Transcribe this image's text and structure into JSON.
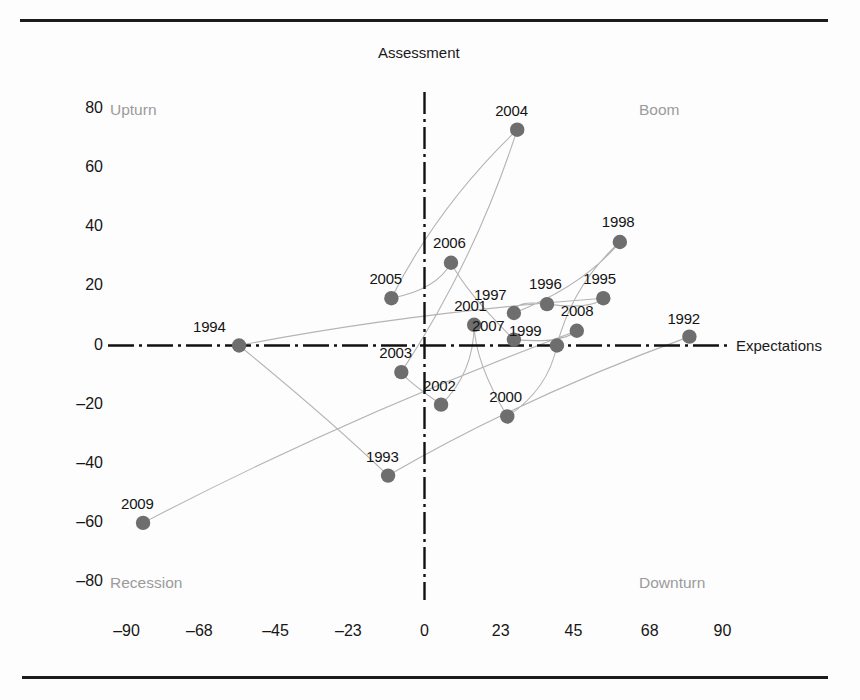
{
  "figure": {
    "background_color": "#fdfdfd",
    "rule_color": "#1c1c1c",
    "point_color": "#6e6e6e",
    "line_color": "#b4b4b4",
    "axis_color": "#111111",
    "quadrant_label_color": "#9b9b9b"
  },
  "axes": {
    "y_axis_title": "Assessment",
    "x_axis_title": "Expectations",
    "y_ticks": [
      "80",
      "60",
      "40",
      "20",
      "0",
      "–20",
      "–40",
      "–60",
      "–80"
    ],
    "x_ticks": [
      "–90",
      "–68",
      "–45",
      "–23",
      "0",
      "23",
      "45",
      "68",
      "90"
    ]
  },
  "quadrants": {
    "top_left": "Upturn",
    "top_right": "Boom",
    "bottom_left": "Recession",
    "bottom_right": "Downturn"
  },
  "chart_data": {
    "type": "scatter",
    "title": "",
    "subtitle": "",
    "xlabel": "Expectations",
    "ylabel": "Assessment",
    "xlim": [
      -100,
      100
    ],
    "ylim": [
      -88,
      88
    ],
    "grid": false,
    "legend": "none",
    "annotations": [
      "Upturn",
      "Boom",
      "Recession",
      "Downturn"
    ],
    "connected": true,
    "connection_order": [
      "1992",
      "1993",
      "1994",
      "1995",
      "1996",
      "1997",
      "1998",
      "1999",
      "2000",
      "2001",
      "2002",
      "2003",
      "2004",
      "2005",
      "2006",
      "2007",
      "2008",
      "2009"
    ],
    "x_tick_values": [
      -90,
      -68,
      -45,
      -23,
      0,
      23,
      45,
      68,
      90
    ],
    "y_tick_values": [
      80,
      60,
      40,
      20,
      0,
      -20,
      -40,
      -60,
      -80
    ],
    "points": [
      {
        "label": "1992",
        "x": 80,
        "y": 3
      },
      {
        "label": "1993",
        "x": -11,
        "y": -44
      },
      {
        "label": "1994",
        "x": -56,
        "y": 0
      },
      {
        "label": "1995",
        "x": 54,
        "y": 16
      },
      {
        "label": "1996",
        "x": 37,
        "y": 14
      },
      {
        "label": "1997",
        "x": 27,
        "y": 11
      },
      {
        "label": "1998",
        "x": 59,
        "y": 35
      },
      {
        "label": "1999",
        "x": 40,
        "y": 0
      },
      {
        "label": "2000",
        "x": 25,
        "y": -24
      },
      {
        "label": "2001",
        "x": 15,
        "y": 7
      },
      {
        "label": "2002",
        "x": 5,
        "y": -20
      },
      {
        "label": "2003",
        "x": -7,
        "y": -9
      },
      {
        "label": "2004",
        "x": 28,
        "y": 73
      },
      {
        "label": "2005",
        "x": -10,
        "y": 16
      },
      {
        "label": "2006",
        "x": 8,
        "y": 28
      },
      {
        "label": "2007",
        "x": 27,
        "y": 2
      },
      {
        "label": "2008",
        "x": 46,
        "y": 5
      },
      {
        "label": "2009",
        "x": -85,
        "y": -60
      }
    ]
  }
}
